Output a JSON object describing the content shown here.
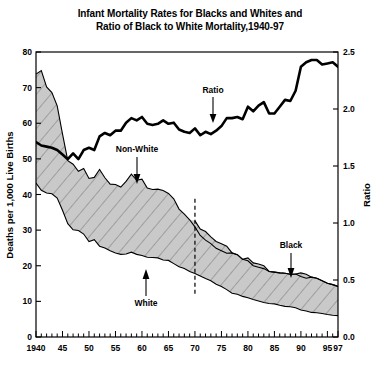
{
  "chart_data": {
    "type": "area",
    "title": "Infant Mortality Rates for Blacks and Whites and\nRatio of Black to White Mortality,1940-97",
    "xlabel": "",
    "ylabel": "Deaths per 1,000 Live Births",
    "y2label": "Ratio",
    "xlim": [
      1940,
      1997
    ],
    "ylim": [
      0,
      80
    ],
    "y2lim": [
      0.0,
      2.5
    ],
    "grid": false,
    "legend_position": "inline-annotations",
    "x_ticks": [
      1940,
      1945,
      1950,
      1955,
      1960,
      1965,
      1970,
      1975,
      1980,
      1985,
      1990,
      1995,
      1997
    ],
    "x_tick_labels": [
      "1940",
      "45",
      "50",
      "55",
      "60",
      "65",
      "70",
      "75",
      "80",
      "85",
      "90",
      "95",
      "97"
    ],
    "x_minor_tick_step": 1,
    "y_ticks": [
      0,
      10,
      20,
      30,
      40,
      50,
      60,
      70,
      80
    ],
    "y_tick_labels": [
      "0",
      "10",
      "20",
      "30",
      "40",
      "50",
      "60",
      "70",
      "80"
    ],
    "y2_ticks": [
      0.0,
      0.5,
      1.0,
      1.5,
      2.0,
      2.5
    ],
    "y2_tick_labels": [
      "0.0",
      "0.5",
      "1.0",
      "1.5",
      "2.0",
      "2.5"
    ],
    "annotations": [
      {
        "label": "Ratio",
        "arrow": "down",
        "x": 1966,
        "series": "ratio"
      },
      {
        "label": "Non-White",
        "arrow": "down",
        "x": 1958,
        "series": "non-white"
      },
      {
        "label": "White",
        "arrow": "up",
        "x": 1960,
        "series": "white"
      },
      {
        "label": "Black",
        "arrow": "down",
        "x": 1988,
        "series": "black"
      },
      {
        "label": "",
        "type": "vertical-dashed-line",
        "x": 1970
      }
    ],
    "x": [
      1940,
      1941,
      1942,
      1943,
      1944,
      1945,
      1946,
      1947,
      1948,
      1949,
      1950,
      1951,
      1952,
      1953,
      1954,
      1955,
      1956,
      1957,
      1958,
      1959,
      1960,
      1961,
      1962,
      1963,
      1964,
      1965,
      1966,
      1967,
      1968,
      1969,
      1970,
      1971,
      1972,
      1973,
      1974,
      1975,
      1976,
      1977,
      1978,
      1979,
      1980,
      1981,
      1982,
      1983,
      1984,
      1985,
      1986,
      1987,
      1988,
      1989,
      1990,
      1991,
      1992,
      1993,
      1994,
      1995,
      1996,
      1997
    ],
    "series": [
      {
        "name": "Non-White",
        "axis": "left",
        "values": [
          73.8,
          74.8,
          70.2,
          68.6,
          64.9,
          57.0,
          49.5,
          48.5,
          46.5,
          47.3,
          44.5,
          44.8,
          47.0,
          44.7,
          42.9,
          42.8,
          42.1,
          43.7,
          45.7,
          44.0,
          44.3,
          41.8,
          41.4,
          41.5,
          41.1,
          40.3,
          38.8,
          35.9,
          34.5,
          32.9,
          30.9,
          28.5,
          27.2,
          26.2,
          24.9,
          24.2,
          23.5,
          23.6,
          23.1,
          21.8,
          21.4,
          20.0,
          19.6,
          19.2,
          18.4,
          18.2,
          18.0,
          17.9,
          17.6,
          17.7,
          17.0,
          16.5,
          16.8,
          16.5,
          15.8,
          15.1,
          14.7,
          14.2
        ]
      },
      {
        "name": "Black",
        "axis": "left",
        "values": [
          null,
          null,
          null,
          null,
          null,
          null,
          null,
          null,
          null,
          null,
          null,
          null,
          null,
          null,
          null,
          null,
          null,
          null,
          null,
          null,
          null,
          null,
          null,
          null,
          null,
          null,
          null,
          null,
          null,
          null,
          32.6,
          30.3,
          29.6,
          28.1,
          26.8,
          26.2,
          25.5,
          23.6,
          23.1,
          21.8,
          22.2,
          20.8,
          20.5,
          20.0,
          18.4,
          18.2,
          18.0,
          17.9,
          17.6,
          17.7,
          18.0,
          17.6,
          16.8,
          16.5,
          15.8,
          15.1,
          14.7,
          14.2
        ]
      },
      {
        "name": "White",
        "axis": "left",
        "values": [
          43.2,
          41.2,
          40.4,
          40.2,
          39.0,
          35.6,
          31.8,
          30.1,
          29.9,
          28.9,
          26.8,
          27.3,
          25.5,
          25.0,
          24.2,
          23.6,
          23.2,
          23.3,
          23.8,
          23.2,
          22.9,
          22.4,
          22.3,
          22.2,
          21.6,
          21.5,
          20.6,
          19.7,
          19.2,
          18.4,
          17.8,
          17.1,
          16.4,
          15.8,
          14.8,
          14.2,
          13.3,
          12.3,
          12.0,
          11.4,
          11.0,
          10.5,
          10.1,
          9.7,
          9.4,
          9.3,
          8.9,
          8.6,
          8.5,
          8.2,
          7.6,
          7.3,
          6.9,
          6.8,
          6.6,
          6.3,
          6.1,
          6.0
        ]
      },
      {
        "name": "Ratio",
        "axis": "right",
        "values": [
          1.71,
          1.68,
          1.67,
          1.66,
          1.64,
          1.6,
          1.56,
          1.61,
          1.56,
          1.64,
          1.66,
          1.64,
          1.76,
          1.79,
          1.77,
          1.81,
          1.81,
          1.88,
          1.92,
          1.9,
          1.93,
          1.87,
          1.86,
          1.87,
          1.9,
          1.87,
          1.88,
          1.82,
          1.8,
          1.79,
          1.83,
          1.77,
          1.8,
          1.78,
          1.81,
          1.85,
          1.92,
          1.92,
          1.93,
          1.91,
          2.02,
          1.98,
          2.03,
          2.06,
          1.96,
          1.96,
          2.02,
          2.08,
          2.07,
          2.16,
          2.37,
          2.41,
          2.43,
          2.43,
          2.39,
          2.4,
          2.41,
          2.37
        ]
      }
    ]
  },
  "axes": {
    "left_title": "Deaths per 1,000 Live Births",
    "right_title": "Ratio"
  },
  "annotations": {
    "ratio": "Ratio",
    "non_white": "Non-White",
    "white": "White",
    "black": "Black"
  },
  "colors": {
    "band_fill": "#c9c9c9",
    "line": "#000000",
    "background": "#ffffff",
    "hatch": "#6b6b6b"
  }
}
